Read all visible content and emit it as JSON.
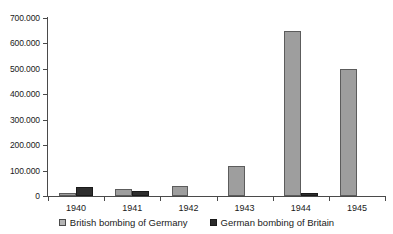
{
  "chart_data": {
    "type": "bar",
    "title": "",
    "subtitle": "",
    "xlabel": "",
    "ylabel": "",
    "categories": [
      "1940",
      "1941",
      "1942",
      "1943",
      "1944",
      "1945"
    ],
    "series": [
      {
        "name": "British bombing of Germany",
        "color": "#9e9e9e",
        "values": [
          10000,
          27000,
          38000,
          120000,
          650000,
          500000
        ]
      },
      {
        "name": "German bombing of Britain",
        "color": "#2e2e2e",
        "values": [
          37000,
          20000,
          0,
          0,
          10000,
          0
        ]
      }
    ],
    "ylim": [
      0,
      700000
    ],
    "ytick_values": [
      0,
      100000,
      200000,
      300000,
      400000,
      500000,
      600000,
      700000
    ],
    "ytick_labels": [
      "0",
      "100.000",
      "200.000",
      "300.000",
      "400.000",
      "500.000",
      "600.000",
      "700.000"
    ],
    "grid": false,
    "legend_position": "bottom"
  },
  "legend": {
    "items": [
      {
        "label": "British bombing of Germany",
        "swatch": "british-swatch"
      },
      {
        "label": "German bombing of Britain",
        "swatch": "german-swatch"
      }
    ]
  }
}
